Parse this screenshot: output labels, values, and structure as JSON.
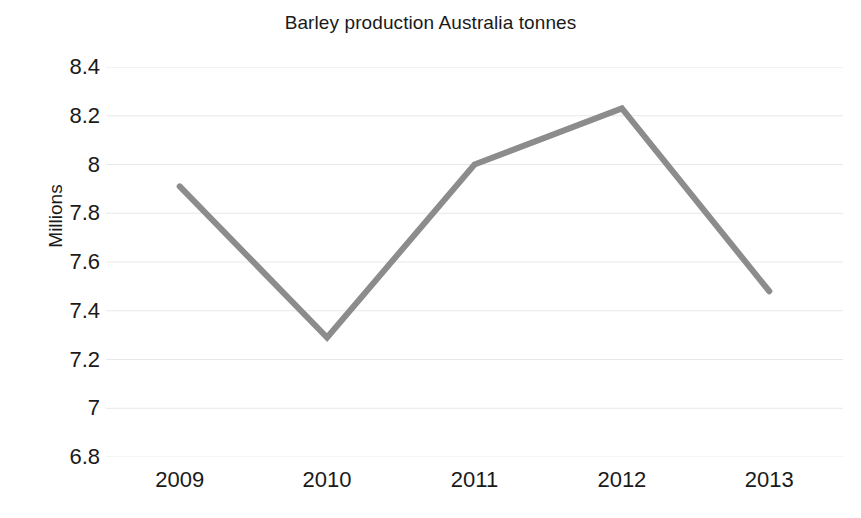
{
  "chart_data": {
    "type": "line",
    "title": "Barley production Australia tonnes",
    "xlabel": "",
    "ylabel": "Millions",
    "categories": [
      "2009",
      "2010",
      "2011",
      "2012",
      "2013"
    ],
    "x": [
      2009,
      2010,
      2011,
      2012,
      2013
    ],
    "series": [
      {
        "name": "Barley production",
        "values": [
          7.91,
          7.29,
          8.0,
          8.23,
          7.48
        ],
        "color": "#8c8c8c",
        "line_width": 6,
        "markers": false
      }
    ],
    "values": [
      7.91,
      7.29,
      8.0,
      8.23,
      7.48
    ],
    "ylim": [
      6.8,
      8.4
    ],
    "ytick_step": 0.2,
    "ytick_labels": [
      "8.4",
      "8.2",
      "8",
      "7.8",
      "7.6",
      "7.4",
      "7.2",
      "7",
      "6.8"
    ],
    "ytick_values": [
      8.4,
      8.2,
      8.0,
      7.8,
      7.6,
      7.4,
      7.2,
      7.0,
      6.8
    ],
    "xtick_labels": [
      "2009",
      "2010",
      "2011",
      "2012",
      "2013"
    ],
    "grid": {
      "horizontal": true,
      "vertical": false,
      "color": "#e8e8e8"
    },
    "legend": {
      "visible": false,
      "position": "none"
    },
    "background_color": "#ffffff",
    "axis_line_visible": false
  }
}
